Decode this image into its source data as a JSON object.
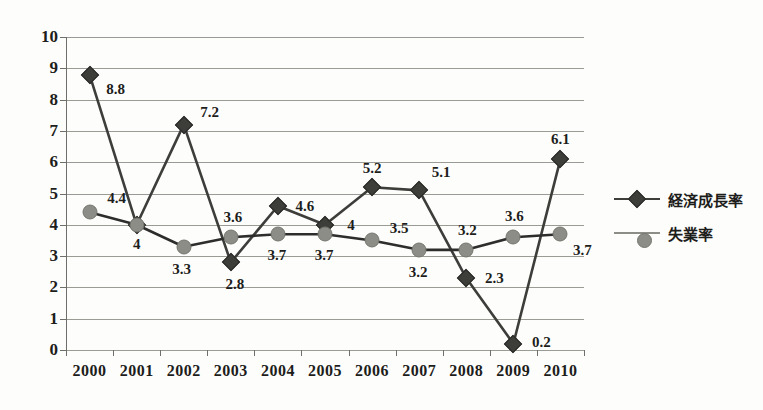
{
  "chart_data": {
    "type": "line",
    "title": "",
    "subtitle": "",
    "xlabel": "",
    "ylabel": "",
    "categories": [
      "2000",
      "2001",
      "2002",
      "2003",
      "2004",
      "2005",
      "2006",
      "2007",
      "2008",
      "2009",
      "2010"
    ],
    "ylim": [
      0,
      10
    ],
    "ytick_labels": [
      "10",
      "9",
      "8",
      "7",
      "6",
      "5",
      "4",
      "3",
      "2",
      "1",
      "0"
    ],
    "ytick_values": [
      10,
      9,
      8,
      7,
      6,
      5,
      4,
      3,
      2,
      1,
      0
    ],
    "grid": true,
    "grid_axis": "y",
    "legend_position": "right",
    "series": [
      {
        "name": "経済成長率",
        "marker": "diamond",
        "color": "#3d3d3a",
        "line_color": "#3d3d3a",
        "values": [
          8.8,
          4,
          7.2,
          2.8,
          4.6,
          4,
          5.2,
          5.1,
          2.3,
          0.2,
          6.1
        ],
        "labels": [
          "8.8",
          "4",
          "7.2",
          "2.8",
          "4.6",
          "4",
          "5.2",
          "5.1",
          "2.3",
          "0.2",
          "6.1"
        ],
        "label_offsets": [
          {
            "dx": 26,
            "dy": 14
          },
          {
            "dx": 0,
            "dy": 19
          },
          {
            "dx": 26,
            "dy": -13
          },
          {
            "dx": 4,
            "dy": 22
          },
          {
            "dx": 27,
            "dy": 0
          },
          {
            "dx": 26,
            "dy": 0
          },
          {
            "dx": 0,
            "dy": -19
          },
          {
            "dx": 22,
            "dy": -18
          },
          {
            "dx": 28,
            "dy": 0
          },
          {
            "dx": 28,
            "dy": -2
          },
          {
            "dx": 0,
            "dy": -20
          }
        ]
      },
      {
        "name": "失業率",
        "marker": "circle",
        "color": "#8d8d87",
        "line_color": "#2d2d2b",
        "values": [
          4.4,
          4,
          3.3,
          3.6,
          3.7,
          3.7,
          3.5,
          3.2,
          3.2,
          3.6,
          3.7
        ],
        "labels": [
          "4.4",
          "4",
          "3.3",
          "3.6",
          "3.7",
          "3.7",
          "3.5",
          "3.2",
          "3.2",
          "3.6",
          "3.7"
        ],
        "label_offsets": [
          {
            "dx": 27,
            "dy": -14
          },
          {
            "dx": 0,
            "dy": 0
          },
          {
            "dx": -2,
            "dy": 22
          },
          {
            "dx": 2,
            "dy": -20
          },
          {
            "dx": -1,
            "dy": 21
          },
          {
            "dx": -1,
            "dy": 21
          },
          {
            "dx": 27,
            "dy": -12
          },
          {
            "dx": -1,
            "dy": 22
          },
          {
            "dx": 1,
            "dy": -20
          },
          {
            "dx": 1,
            "dy": -21
          },
          {
            "dx": 22,
            "dy": 16
          }
        ]
      }
    ],
    "legend": [
      {
        "name": "経済成長率",
        "marker": "diamond",
        "color": "#3d3d3a"
      },
      {
        "name": "失業率",
        "marker": "circle",
        "color": "#8d8d87"
      }
    ]
  },
  "colors": {
    "background": "#fdfdfc",
    "gridline": "#9b9b96",
    "axis": "#6e6e6a",
    "text": "#1d1d1b",
    "growth": "#3d3d3a",
    "unemployment": "#8d8d87"
  }
}
